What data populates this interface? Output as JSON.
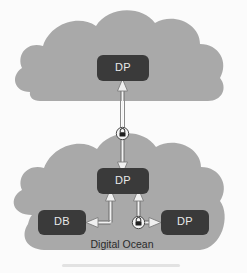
{
  "diagram": {
    "background_color": "#fbfbfb",
    "cloud_color": "#a9a9a9",
    "node_color": "#3a3a3a",
    "node_text_color": "#e9e9e9",
    "connector_color": "#8a8a8a",
    "clouds": [
      {
        "id": "upper-cloud",
        "label": "",
        "nodes": [
          "top-dp"
        ]
      },
      {
        "id": "lower-cloud",
        "label": "Digital Ocean",
        "nodes": [
          "middle-dp",
          "db",
          "bottom-dp"
        ]
      }
    ],
    "nodes": [
      {
        "id": "top-dp",
        "label": "DP"
      },
      {
        "id": "middle-dp",
        "label": "DP"
      },
      {
        "id": "db",
        "label": "DB"
      },
      {
        "id": "bottom-dp",
        "label": "DP"
      }
    ],
    "connectors": [
      {
        "id": "conn-top",
        "from": "middle-dp",
        "to": "top-dp",
        "direction": "bidirectional",
        "secured": true,
        "badge": "lock-icon"
      },
      {
        "id": "conn-db",
        "from": "middle-dp",
        "to": "db",
        "direction": "bidirectional",
        "secured": false,
        "badge": ""
      },
      {
        "id": "conn-bottom-dp",
        "from": "middle-dp",
        "to": "bottom-dp",
        "direction": "bidirectional",
        "secured": true,
        "badge": "lock-icon"
      }
    ],
    "badges": [
      {
        "id": "lock-upper",
        "icon": "lock-icon"
      },
      {
        "id": "lock-lower",
        "icon": "lock-icon"
      }
    ]
  }
}
